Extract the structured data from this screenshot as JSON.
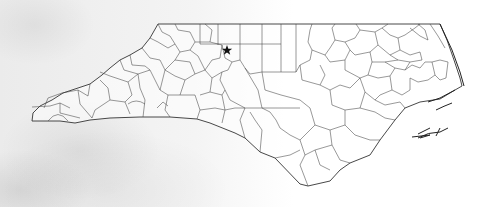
{
  "map": {
    "title": "North Carolina counties",
    "region": "North Carolina",
    "marker": {
      "icon": "star-icon",
      "glyph": "★",
      "x": 227,
      "y": 50,
      "color": "#111111"
    },
    "colors": {
      "border": "#333333",
      "background": "#f2f2f2",
      "land": "#ffffff"
    }
  }
}
